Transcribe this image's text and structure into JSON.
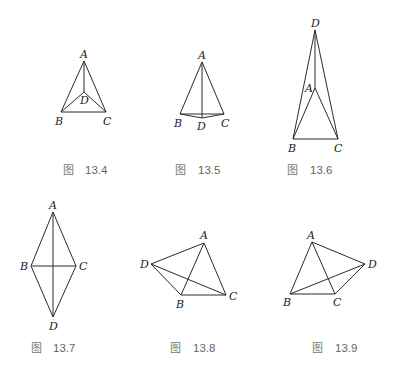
{
  "figures": [
    {
      "id": "fig-13-4",
      "caption_prefix": "图",
      "caption_number": "13.4",
      "points": {
        "A": [
          84,
          61
        ],
        "B": [
          61,
          112
        ],
        "C": [
          106,
          112
        ],
        "D": [
          84,
          92
        ]
      },
      "edges": [
        [
          "A",
          "B"
        ],
        [
          "A",
          "C"
        ],
        [
          "B",
          "C"
        ],
        [
          "A",
          "D"
        ],
        [
          "B",
          "D"
        ],
        [
          "C",
          "D"
        ]
      ],
      "labels": {
        "A": "A",
        "B": "B",
        "C": "C",
        "D": "D"
      }
    },
    {
      "id": "fig-13-5",
      "caption_prefix": "图",
      "caption_number": "13.5",
      "points": {
        "A": [
          202,
          62
        ],
        "B": [
          180,
          114
        ],
        "C": [
          224,
          114
        ],
        "D": [
          202,
          118
        ]
      },
      "edges": [
        [
          "A",
          "B"
        ],
        [
          "A",
          "C"
        ],
        [
          "B",
          "C"
        ],
        [
          "A",
          "D"
        ],
        [
          "B",
          "D"
        ],
        [
          "C",
          "D"
        ]
      ],
      "labels": {
        "A": "A",
        "B": "B",
        "C": "C",
        "D": "D"
      }
    },
    {
      "id": "fig-13-6",
      "caption_prefix": "图",
      "caption_number": "13.6",
      "points": {
        "A": [
          315,
          88
        ],
        "B": [
          293,
          139
        ],
        "C": [
          338,
          139
        ],
        "D": [
          315,
          30
        ]
      },
      "edges": [
        [
          "A",
          "B"
        ],
        [
          "A",
          "C"
        ],
        [
          "B",
          "C"
        ],
        [
          "A",
          "D"
        ],
        [
          "B",
          "D"
        ],
        [
          "C",
          "D"
        ]
      ],
      "labels": {
        "A": "A",
        "B": "B",
        "C": "C",
        "D": "D"
      }
    },
    {
      "id": "fig-13-7",
      "caption_prefix": "图",
      "caption_number": "13.7",
      "points": {
        "A": [
          53,
          212
        ],
        "B": [
          31,
          266
        ],
        "C": [
          76,
          266
        ],
        "D": [
          53,
          317
        ]
      },
      "edges": [
        [
          "A",
          "B"
        ],
        [
          "A",
          "C"
        ],
        [
          "B",
          "C"
        ],
        [
          "A",
          "D"
        ],
        [
          "B",
          "D"
        ],
        [
          "C",
          "D"
        ]
      ],
      "labels": {
        "A": "A",
        "B": "B",
        "C": "C",
        "D": "D"
      }
    },
    {
      "id": "fig-13-8",
      "caption_prefix": "图",
      "caption_number": "13.8",
      "points": {
        "A": [
          204,
          243
        ],
        "B": [
          181,
          295
        ],
        "C": [
          226,
          295
        ],
        "D": [
          151,
          264
        ]
      },
      "edges": [
        [
          "A",
          "B"
        ],
        [
          "A",
          "C"
        ],
        [
          "B",
          "C"
        ],
        [
          "A",
          "D"
        ],
        [
          "B",
          "D"
        ],
        [
          "C",
          "D"
        ]
      ],
      "labels": {
        "A": "A",
        "B": "B",
        "C": "C",
        "D": "D"
      }
    },
    {
      "id": "fig-13-9",
      "caption_prefix": "图",
      "caption_number": "13.9",
      "points": {
        "A": [
          312,
          242
        ],
        "B": [
          290,
          294
        ],
        "C": [
          335,
          294
        ],
        "D": [
          365,
          264
        ]
      },
      "edges": [
        [
          "A",
          "B"
        ],
        [
          "A",
          "C"
        ],
        [
          "B",
          "C"
        ],
        [
          "A",
          "D"
        ],
        [
          "B",
          "D"
        ],
        [
          "C",
          "D"
        ]
      ],
      "labels": {
        "A": "A",
        "B": "B",
        "C": "C",
        "D": "D"
      }
    }
  ]
}
